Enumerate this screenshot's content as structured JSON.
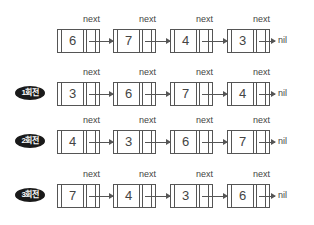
{
  "labels": {
    "next": "next",
    "nil": "nil"
  },
  "rows": [
    {
      "badge": "",
      "top": 14,
      "values": [
        "6",
        "7",
        "4",
        "3"
      ]
    },
    {
      "badge": "1회전",
      "top": 67,
      "values": [
        "3",
        "6",
        "7",
        "4"
      ]
    },
    {
      "badge": "2회전",
      "top": 115,
      "values": [
        "4",
        "3",
        "6",
        "7"
      ]
    },
    {
      "badge": "3회전",
      "top": 169,
      "values": [
        "7",
        "4",
        "3",
        "6"
      ]
    }
  ],
  "colors": {
    "line": "#555555",
    "badge_bg": "#1a1a1a",
    "text": "#444444"
  }
}
